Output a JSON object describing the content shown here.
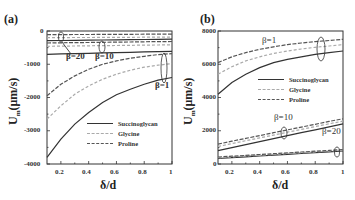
{
  "chart_data": [
    {
      "panel": "(a)",
      "type": "line",
      "title": "",
      "xlabel": "δ/d",
      "ylabel": "U_m (μm/s)",
      "xlim": [
        0.1,
        1.0
      ],
      "ylim": [
        -4000,
        0
      ],
      "xticks": [
        "0.2",
        "0.4",
        "0.6",
        "0.8",
        "1"
      ],
      "yticks": [
        "0",
        "-1000",
        "-2000",
        "-3000",
        "-4000"
      ],
      "grid": false,
      "legend": [
        "Succinoglycan",
        "Glycine",
        "Proline"
      ],
      "legend_position": "lower right",
      "annotations": [
        "β=20",
        "β=10",
        "β=1"
      ],
      "x": [
        0.1,
        0.2,
        0.3,
        0.4,
        0.5,
        0.6,
        0.7,
        0.8,
        0.9,
        1.0
      ],
      "series": [
        {
          "name": "Succinoglycan β=1",
          "values": [
            -3800,
            -3250,
            -2800,
            -2450,
            -2150,
            -1920,
            -1750,
            -1600,
            -1480,
            -1400
          ]
        },
        {
          "name": "Glycine β=1",
          "values": [
            -2650,
            -2250,
            -1900,
            -1650,
            -1450,
            -1300,
            -1180,
            -1090,
            -1030,
            -980
          ]
        },
        {
          "name": "Proline β=1",
          "values": [
            -1950,
            -1600,
            -1350,
            -1150,
            -1000,
            -900,
            -820,
            -760,
            -710,
            -680
          ]
        },
        {
          "name": "Succinoglycan β=10",
          "values": [
            -700,
            -690,
            -680,
            -670,
            -660,
            -650,
            -640,
            -630,
            -620,
            -610
          ]
        },
        {
          "name": "Glycine β=10",
          "values": [
            -460,
            -455,
            -450,
            -445,
            -440,
            -435,
            -430,
            -425,
            -420,
            -415
          ]
        },
        {
          "name": "Proline β=10",
          "values": [
            -360,
            -355,
            -350,
            -345,
            -340,
            -335,
            -330,
            -325,
            -320,
            -315
          ]
        },
        {
          "name": "Succinoglycan β=20",
          "values": [
            -290,
            -285,
            -280,
            -275,
            -270,
            -265,
            -260,
            -255,
            -250,
            -245
          ]
        },
        {
          "name": "Glycine β=20",
          "values": [
            -200,
            -198,
            -196,
            -194,
            -192,
            -190,
            -188,
            -186,
            -184,
            -182
          ]
        },
        {
          "name": "Proline β=20",
          "values": [
            -110,
            -108,
            -106,
            -104,
            -102,
            -100,
            -98,
            -96,
            -94,
            -92
          ]
        }
      ]
    },
    {
      "panel": "(b)",
      "type": "line",
      "title": "",
      "xlabel": "δ/d",
      "ylabel": "U_m (μm/s)",
      "xlim": [
        0.1,
        1.0
      ],
      "ylim": [
        0,
        8000
      ],
      "xticks": [
        "0.2",
        "0.4",
        "0.6",
        "0.8",
        "1"
      ],
      "yticks": [
        "8000",
        "6000",
        "4000",
        "2000",
        "0"
      ],
      "grid": false,
      "legend": [
        "Succinoglycan",
        "Glycine",
        "Proline"
      ],
      "legend_position": "center right",
      "annotations": [
        "β=1",
        "β=10",
        "β=20"
      ],
      "x": [
        0.1,
        0.2,
        0.3,
        0.4,
        0.5,
        0.6,
        0.7,
        0.8,
        0.9,
        1.0
      ],
      "series": [
        {
          "name": "Succinoglycan β=1",
          "values": [
            4200,
            4900,
            5400,
            5800,
            6100,
            6300,
            6450,
            6600,
            6700,
            6800
          ]
        },
        {
          "name": "Glycine β=1",
          "values": [
            5400,
            5850,
            6200,
            6450,
            6650,
            6800,
            6920,
            7020,
            7100,
            7180
          ]
        },
        {
          "name": "Proline β=1",
          "values": [
            6100,
            6450,
            6700,
            6900,
            7050,
            7180,
            7280,
            7360,
            7430,
            7500
          ]
        },
        {
          "name": "Succinoglycan β=10",
          "values": [
            800,
            980,
            1160,
            1340,
            1520,
            1700,
            1880,
            2060,
            2240,
            2420
          ]
        },
        {
          "name": "Glycine β=10",
          "values": [
            1050,
            1230,
            1400,
            1570,
            1740,
            1910,
            2080,
            2250,
            2420,
            2580
          ]
        },
        {
          "name": "Proline β=10",
          "values": [
            1200,
            1370,
            1540,
            1710,
            1880,
            2050,
            2220,
            2390,
            2560,
            2720
          ]
        },
        {
          "name": "Succinoglycan β=20",
          "values": [
            330,
            380,
            430,
            480,
            530,
            580,
            630,
            680,
            730,
            780
          ]
        },
        {
          "name": "Glycine β=20",
          "values": [
            380,
            430,
            480,
            530,
            580,
            630,
            680,
            730,
            780,
            830
          ]
        },
        {
          "name": "Proline β=20",
          "values": [
            420,
            470,
            520,
            570,
            620,
            670,
            720,
            770,
            820,
            870
          ]
        }
      ]
    }
  ],
  "panels": [
    {
      "label": "(a)",
      "xlabel": "δ/d",
      "ylabel_main": "U",
      "ylabel_sub": "m",
      "ylabel_unit": "(μm/s)",
      "yticks": [
        "0",
        "-1000",
        "-2000",
        "-3000",
        "-4000"
      ],
      "xticks": [
        "0.2",
        "0.4",
        "0.6",
        "0.8",
        "1"
      ],
      "annotations": {
        "b20": "β=20",
        "b10": "β=10",
        "b1": "β=1"
      },
      "legend": [
        "Succinoglycan",
        "Glycine",
        "Proline"
      ]
    },
    {
      "label": "(b)",
      "xlabel": "δ/d",
      "ylabel_main": "U",
      "ylabel_sub": "m",
      "ylabel_unit": "(μm/s)",
      "yticks": [
        "8000",
        "6000",
        "4000",
        "2000",
        "0"
      ],
      "xticks": [
        "0.2",
        "0.4",
        "0.6",
        "0.8",
        "1"
      ],
      "annotations": {
        "b1": "β=1",
        "b10": "β=10",
        "b20": "β=20"
      },
      "legend": [
        "Succinoglycan",
        "Glycine",
        "Proline"
      ]
    }
  ],
  "colors": {
    "succinoglycan": "#333333",
    "glycine": "#aaaaaa",
    "proline": "#555555",
    "axis": "#333333"
  }
}
